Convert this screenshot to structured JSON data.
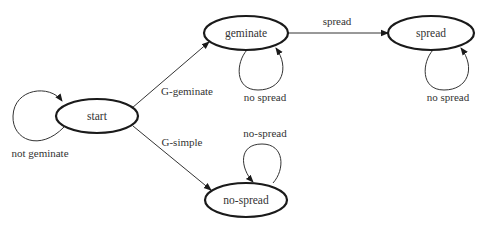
{
  "diagram": {
    "type": "state-transition",
    "colors": {
      "background": "#ffffff",
      "node_stroke": "#1a1a1a",
      "edge_stroke": "#333333",
      "text": "#333333"
    },
    "nodes": [
      {
        "id": "start",
        "label": "start"
      },
      {
        "id": "geminate",
        "label": "geminate"
      },
      {
        "id": "spread",
        "label": "spread"
      },
      {
        "id": "no-spread",
        "label": "no-spread"
      }
    ],
    "edges": [
      {
        "from": "start",
        "to": "start",
        "label": "not geminate"
      },
      {
        "from": "start",
        "to": "geminate",
        "label": "G-geminate"
      },
      {
        "from": "start",
        "to": "no-spread",
        "label": "G-simple"
      },
      {
        "from": "geminate",
        "to": "spread",
        "label": "spread"
      },
      {
        "from": "geminate",
        "to": "geminate",
        "label": "no spread"
      },
      {
        "from": "spread",
        "to": "spread",
        "label": "no spread"
      },
      {
        "from": "no-spread",
        "to": "no-spread",
        "label": "no-spread"
      }
    ]
  }
}
